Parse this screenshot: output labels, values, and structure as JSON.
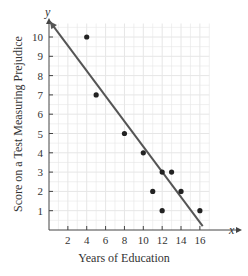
{
  "chart_data": {
    "type": "scatter",
    "title": "",
    "xlabel": "Years of Education",
    "ylabel": "Score on a Test Measuring Prejudice",
    "x_axis_var": "x",
    "y_axis_var": "y",
    "xlim": [
      0,
      17
    ],
    "ylim": [
      0,
      10.7
    ],
    "x_ticks": [
      2,
      4,
      6,
      8,
      10,
      12,
      14,
      16
    ],
    "y_ticks": [
      1,
      2,
      3,
      4,
      5,
      6,
      7,
      8,
      9,
      10
    ],
    "grid": true,
    "legend": null,
    "points": [
      {
        "x": 4,
        "y": 10
      },
      {
        "x": 5,
        "y": 7
      },
      {
        "x": 8,
        "y": 5
      },
      {
        "x": 10,
        "y": 4
      },
      {
        "x": 11,
        "y": 2
      },
      {
        "x": 12,
        "y": 3
      },
      {
        "x": 12,
        "y": 1
      },
      {
        "x": 13,
        "y": 3
      },
      {
        "x": 14,
        "y": 2
      },
      {
        "x": 16,
        "y": 1
      }
    ],
    "regression_line": {
      "x1": 0.1,
      "y1": 10.8,
      "x2": 16.3,
      "y2": 0.2,
      "arrow_start": true
    },
    "colors": {
      "grid": "#e6e6e6",
      "axis": "#444444",
      "point": "#222222",
      "line": "#555555"
    }
  }
}
